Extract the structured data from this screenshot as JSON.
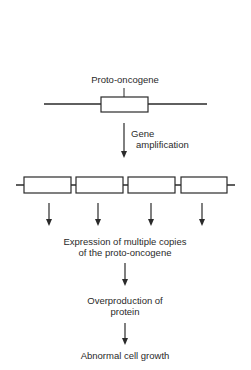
{
  "diagram": {
    "title_label": "Proto-oncogene",
    "step_label_line1": "Gene",
    "step_label_line2": "amplification",
    "amplified_copies": 4,
    "expression_line1": "Expression of multiple copies",
    "expression_line2": "of the proto-oncogene",
    "overproduction_line1": "Overproduction of",
    "overproduction_line2": "protein",
    "outcome": "Abnormal cell growth",
    "colors": {
      "line": "#2a2a2a",
      "box_fill": "#ffffff",
      "background": "#ffffff"
    }
  }
}
